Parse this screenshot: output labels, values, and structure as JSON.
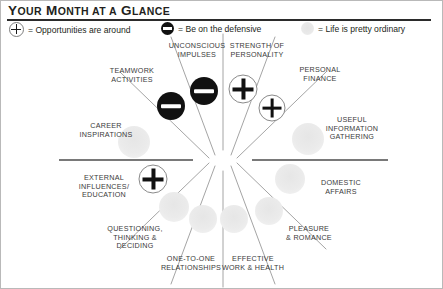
{
  "header": {
    "title_main": "Y",
    "title": "YOUR MONTH AT A GLANCE"
  },
  "legend": [
    {
      "symbol": "plus",
      "icon": "plus-circle-icon",
      "text": "= Opportunities are around"
    },
    {
      "symbol": "minus",
      "icon": "minus-circle-icon",
      "text": "= Be on the defensive"
    },
    {
      "symbol": "neutral",
      "icon": "neutral-circle-icon",
      "text": "= Life is pretty ordinary"
    }
  ],
  "wheel": {
    "sectors": [
      {
        "label": "TEAMWORK\nACTIVITIES",
        "state": "minus"
      },
      {
        "label": "UNCONSCIOUS\nIMPULSES",
        "state": "minus"
      },
      {
        "label": "STRENGTH OF\nPERSONALITY",
        "state": "plus"
      },
      {
        "label": "PERSONAL\nFINANCE",
        "state": "plus"
      },
      {
        "label": "USEFUL\nINFORMATION\nGATHERING",
        "state": "neutral"
      },
      {
        "label": "DOMESTIC\nAFFAIRS",
        "state": "neutral"
      },
      {
        "label": "PLEASURE\n& ROMANCE",
        "state": "neutral"
      },
      {
        "label": "EFFECTIVE\nWORK & HEALTH",
        "state": "neutral"
      },
      {
        "label": "ONE-TO-ONE\nRELATIONSHIPS",
        "state": "neutral"
      },
      {
        "label": "QUESTIONING,\nTHINKING &\nDECIDING",
        "state": "neutral"
      },
      {
        "label": "EXTERNAL\nINFLUENCES/\nEDUCATION",
        "state": "plus"
      },
      {
        "label": "CAREER\nINSPIRATIONS",
        "state": "neutral"
      }
    ]
  },
  "colors": {
    "ink": "#231f20",
    "rule": "#2b2b2b",
    "spoke": "#9a9a9a",
    "marker_dark": "#111111",
    "marker_neutral": "#e9e9e9"
  }
}
